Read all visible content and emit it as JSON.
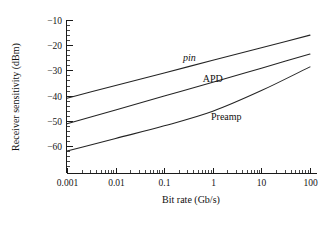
{
  "chart_data": {
    "type": "line",
    "title": "",
    "subtitle": "",
    "xlabel": "Bit rate (Gb/s)",
    "ylabel": "Receiver sensitivity (dBm)",
    "xscale": "log",
    "yscale": "linear",
    "xlim": [
      0.001,
      100
    ],
    "ylim": [
      -70.7,
      -10
    ],
    "grid": false,
    "legend_position": "inline-annotations",
    "xticks": [
      0.001,
      0.01,
      0.1,
      1,
      10,
      100
    ],
    "xtick_labels": [
      "0.001",
      "0.01",
      "0.1",
      "1",
      "10",
      "100"
    ],
    "yticks": [
      -10,
      -20,
      -30,
      -40,
      -50,
      -60
    ],
    "ytick_labels": [
      "−10",
      "−20",
      "−30",
      "−40",
      "−50",
      "−60"
    ],
    "ytick_minor_step": 2,
    "xtick_minor": "log-decade-subdivisions",
    "series": [
      {
        "name": "pin",
        "label": "pin",
        "label_style": "italic",
        "label_x": 0.33,
        "label_y": -26.2,
        "color": "#242424",
        "x": [
          0.001,
          0.01,
          0.1,
          1,
          10,
          100
        ],
        "values": [
          -41.0,
          -36.0,
          -31.0,
          -26.0,
          -21.0,
          -16.0
        ]
      },
      {
        "name": "APD",
        "label": "APD",
        "label_style": "normal",
        "label_x": 1.0,
        "label_y": -34.5,
        "color": "#242424",
        "x": [
          0.001,
          0.01,
          0.1,
          1,
          10,
          100
        ],
        "values": [
          -51.2,
          -45.7,
          -40.2,
          -34.7,
          -29.1,
          -23.5
        ]
      },
      {
        "name": "Preamp",
        "label": "Preamp",
        "label_style": "normal",
        "label_x": 1.9,
        "label_y": -49.6,
        "color": "#242424",
        "x": [
          0.001,
          0.01,
          0.1,
          1,
          10,
          100
        ],
        "values": [
          -62.0,
          -57.0,
          -52.0,
          -46.2,
          -38.0,
          -28.6
        ]
      }
    ]
  },
  "axes": {
    "ylabel": "Receiver sensitivity (dBm)",
    "xlabel": "Bit rate (Gb/s)",
    "ytick_labels": [
      "−10",
      "−20",
      "−30",
      "−40",
      "−50",
      "−60"
    ],
    "xtick_labels": [
      "0.001",
      "0.01",
      "0.1",
      "1",
      "10",
      "100"
    ]
  },
  "annotations": {
    "pin": "pin",
    "apd": "APD",
    "preamp": "Preamp"
  }
}
